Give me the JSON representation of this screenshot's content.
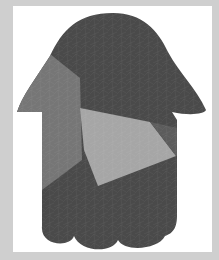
{
  "image": {
    "subject": "hamsa-shape",
    "description": "Tessellated hamsa-like silhouette with a dome top, narrow body and three scalloped lobes at the bottom",
    "colors": {
      "frame": "#cfcfcf",
      "canvas": "#ffffff",
      "shape_dark": "#4a4a4a",
      "facet_mid": "#767676",
      "facet_light": "#a6a6a6",
      "texture_line": "#8a8a8a"
    }
  }
}
